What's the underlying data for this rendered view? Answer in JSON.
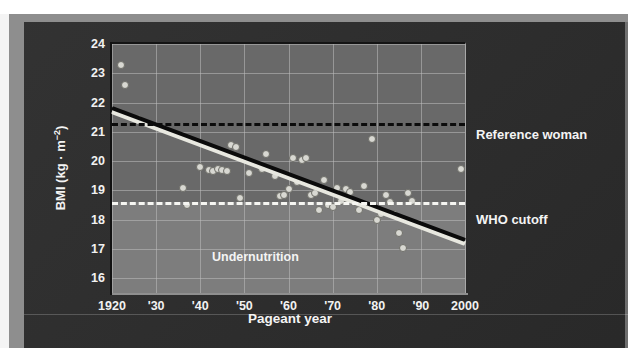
{
  "figure": {
    "background_color": "#2b2b2b",
    "plot_background_color": "#696969",
    "undernutrition_band_color": "#7d7d7d",
    "point_color": "#d8d8d2",
    "trend_color": "#0b0b0b",
    "reference_line_color": "#0c0c0c",
    "who_line_color": "#f6f6f2",
    "text_color": "#f4f4f4"
  },
  "annotations": {
    "reference_woman": "Reference woman",
    "who_cutoff": "WHO cutoff",
    "undernutrition": "Undernutrition"
  },
  "chart_data": {
    "type": "scatter",
    "title": "",
    "xlabel": "Pageant year",
    "ylabel": "BMI (kg · m−2)",
    "ylabel_main": "BMI (kg · m",
    "ylabel_exponent": "−2",
    "ylabel_close": ")",
    "xlim": [
      1920,
      2000
    ],
    "ylim": [
      15.5,
      24.0
    ],
    "grid": true,
    "legend": "none",
    "yticks": [
      24,
      23,
      22,
      21,
      20,
      19,
      18,
      17,
      16
    ],
    "ytick_labels": [
      "24",
      "23",
      "22",
      "21",
      "20",
      "19",
      "18",
      "17",
      "16"
    ],
    "xticks": [
      1920,
      1930,
      1940,
      1950,
      1960,
      1970,
      1980,
      1990,
      2000
    ],
    "xtick_labels": [
      "1920",
      "'30",
      "'40",
      "'50",
      "'60",
      "'70",
      "'80",
      "'90",
      "2000"
    ],
    "reference_lines": [
      {
        "name": "Reference woman",
        "y": 21.3,
        "style": "dashed",
        "color": "#0c0c0c"
      },
      {
        "name": "WHO cutoff",
        "y": 18.6,
        "style": "dashed",
        "color": "#f6f6f2"
      }
    ],
    "shaded_region": {
      "name": "Undernutrition",
      "y_from": 15.5,
      "y_to": 18.6
    },
    "trendline": {
      "x": [
        1920,
        2000
      ],
      "y": [
        21.9,
        17.4
      ],
      "style": "solid",
      "color": "#0b0b0b"
    },
    "series": [
      {
        "name": "Miss America winner BMI",
        "points": [
          [
            1922,
            23.3
          ],
          [
            1923,
            22.6
          ],
          [
            1926,
            21.45
          ],
          [
            1936,
            19.1
          ],
          [
            1937,
            18.5
          ],
          [
            1940,
            19.8
          ],
          [
            1942,
            19.7
          ],
          [
            1943,
            19.65
          ],
          [
            1944,
            19.75
          ],
          [
            1945,
            19.7
          ],
          [
            1946,
            19.65
          ],
          [
            1947,
            20.55
          ],
          [
            1948,
            20.5
          ],
          [
            1949,
            18.75
          ],
          [
            1951,
            19.6
          ],
          [
            1954,
            19.75
          ],
          [
            1955,
            20.25
          ],
          [
            1957,
            19.5
          ],
          [
            1958,
            18.8
          ],
          [
            1959,
            18.85
          ],
          [
            1960,
            19.05
          ],
          [
            1961,
            20.1
          ],
          [
            1962,
            19.3
          ],
          [
            1963,
            20.05
          ],
          [
            1964,
            20.1
          ],
          [
            1965,
            18.85
          ],
          [
            1966,
            18.9
          ],
          [
            1967,
            18.35
          ],
          [
            1968,
            19.35
          ],
          [
            1969,
            18.5
          ],
          [
            1970,
            18.45
          ],
          [
            1971,
            19.1
          ],
          [
            1972,
            18.65
          ],
          [
            1973,
            19.05
          ],
          [
            1974,
            18.95
          ],
          [
            1975,
            18.6
          ],
          [
            1976,
            18.35
          ],
          [
            1977,
            19.15
          ],
          [
            1979,
            20.75
          ],
          [
            1980,
            18.0
          ],
          [
            1981,
            18.2
          ],
          [
            1982,
            18.85
          ],
          [
            1983,
            18.6
          ],
          [
            1984,
            18.2
          ],
          [
            1985,
            17.55
          ],
          [
            1986,
            17.05
          ],
          [
            1987,
            18.9
          ],
          [
            1988,
            18.65
          ],
          [
            1999,
            19.75
          ]
        ]
      }
    ]
  }
}
